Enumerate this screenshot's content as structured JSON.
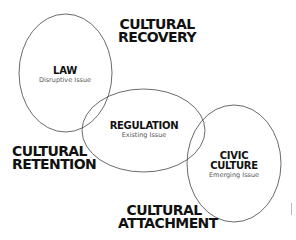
{
  "diagram": {
    "stroke_color": "#444444",
    "nodes": [
      {
        "title": "LAW",
        "subtitle": "Disruptive Issue"
      },
      {
        "title": "REGULATION",
        "subtitle": "Existing Issue"
      },
      {
        "title_line1": "CIVIC",
        "title_line2": "CULTURE",
        "subtitle": "Emerging Issue"
      }
    ],
    "regions": {
      "top": {
        "line1": "CULTURAL",
        "line2": "RECOVERY"
      },
      "left": {
        "line1": "CULTURAL",
        "line2": "RETENTION"
      },
      "bottom": {
        "line1": "CULTURAL",
        "line2": "ATTACHMENT"
      }
    }
  }
}
